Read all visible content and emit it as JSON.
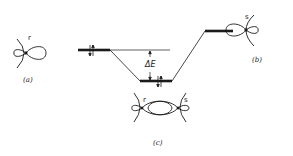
{
  "diagram": {
    "type": "molecular-orbital-energy-level-diagram",
    "orbital_a": {
      "label": "r",
      "caption": "(a)"
    },
    "orbital_b": {
      "label": "s",
      "caption": "(b)"
    },
    "orbital_c": {
      "label_left": "r",
      "label_right": "s",
      "caption": "(c)"
    },
    "energy_gap_label": "ΔE",
    "levels": [
      {
        "name": "orbital-r-level",
        "electrons": 2
      },
      {
        "name": "bonding-level",
        "electrons": 2
      },
      {
        "name": "orbital-s-level",
        "electrons": 0
      }
    ],
    "colors": {
      "ink": "#1a1a1a",
      "background": "#ffffff"
    }
  }
}
